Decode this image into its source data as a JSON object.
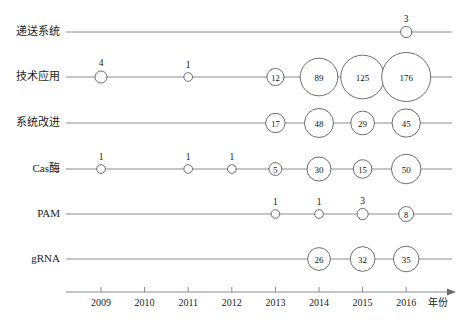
{
  "chart_data": {
    "type": "bubble",
    "title": "",
    "subtitle": "",
    "xlabel": "年份",
    "ylabel": "",
    "x": [
      2009,
      2010,
      2011,
      2012,
      2013,
      2014,
      2015,
      2016
    ],
    "xtick_labels": [
      "2009",
      "2010",
      "2011",
      "2012",
      "2013",
      "2014",
      "2015",
      "2016"
    ],
    "xlim": [
      2008.6,
      2016.8
    ],
    "grid": false,
    "legend": "none",
    "categories": [
      "递送系统",
      "技术应用",
      "系统改进",
      "Cas酶",
      "PAM",
      "gRNA"
    ],
    "series": [
      {
        "name": "递送系统",
        "points": [
          {
            "x": 2016,
            "value": 3,
            "label": "3",
            "label_position": "above"
          }
        ]
      },
      {
        "name": "技术应用",
        "points": [
          {
            "x": 2009,
            "value": 4,
            "label": "4",
            "label_position": "above"
          },
          {
            "x": 2011,
            "value": 1,
            "label": "1",
            "label_position": "above"
          },
          {
            "x": 2013,
            "value": 12,
            "label": "12",
            "label_position": "inside"
          },
          {
            "x": 2014,
            "value": 89,
            "label": "89",
            "label_position": "inside"
          },
          {
            "x": 2015,
            "value": 125,
            "label": "125",
            "label_position": "inside"
          },
          {
            "x": 2016,
            "value": 176,
            "label": "176",
            "label_position": "inside"
          }
        ]
      },
      {
        "name": "系统改进",
        "points": [
          {
            "x": 2013,
            "value": 17,
            "label": "17",
            "label_position": "inside"
          },
          {
            "x": 2014,
            "value": 48,
            "label": "48",
            "label_position": "inside"
          },
          {
            "x": 2015,
            "value": 29,
            "label": "29",
            "label_position": "inside"
          },
          {
            "x": 2016,
            "value": 45,
            "label": "45",
            "label_position": "inside"
          }
        ]
      },
      {
        "name": "Cas酶",
        "points": [
          {
            "x": 2009,
            "value": 1,
            "label": "1",
            "label_position": "above"
          },
          {
            "x": 2011,
            "value": 1,
            "label": "1",
            "label_position": "above"
          },
          {
            "x": 2012,
            "value": 1,
            "label": "1",
            "label_position": "above"
          },
          {
            "x": 2013,
            "value": 5,
            "label": "5",
            "label_position": "inside"
          },
          {
            "x": 2014,
            "value": 30,
            "label": "30",
            "label_position": "inside"
          },
          {
            "x": 2015,
            "value": 15,
            "label": "15",
            "label_position": "inside"
          },
          {
            "x": 2016,
            "value": 50,
            "label": "50",
            "label_position": "inside"
          }
        ]
      },
      {
        "name": "PAM",
        "points": [
          {
            "x": 2013,
            "value": 1,
            "label": "1",
            "label_position": "above"
          },
          {
            "x": 2014,
            "value": 1,
            "label": "1",
            "label_position": "above"
          },
          {
            "x": 2015,
            "value": 3,
            "label": "3",
            "label_position": "above"
          },
          {
            "x": 2016,
            "value": 8,
            "label": "8",
            "label_position": "inside"
          }
        ]
      },
      {
        "name": "gRNA",
        "points": [
          {
            "x": 2014,
            "value": 26,
            "label": "26",
            "label_position": "inside"
          },
          {
            "x": 2015,
            "value": 32,
            "label": "32",
            "label_position": "inside"
          },
          {
            "x": 2016,
            "value": 35,
            "label": "35",
            "label_position": "inside"
          }
        ]
      }
    ],
    "colors": {
      "line": "#8c8c8c",
      "bubble_stroke": "#5f5f5f",
      "bubble_fill": "#ffffff",
      "text": "#1c1c1c",
      "background": "#ffffff"
    }
  }
}
